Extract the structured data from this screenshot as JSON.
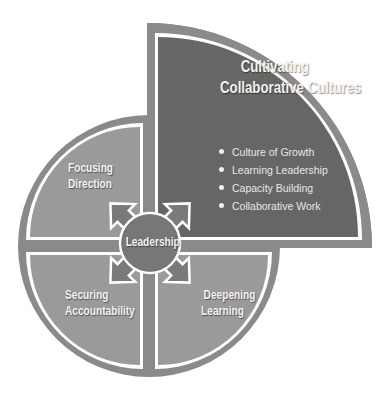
{
  "diagram": {
    "main_quadrant": {
      "title_line1": "Cultivating",
      "title_line2": "Collaborative Cultures",
      "bullets": [
        "Culture of Growth",
        "Learning Leadership",
        "Capacity Building",
        "Collaborative Work"
      ]
    },
    "quadrants": {
      "top_left": {
        "line1": "Focusing",
        "line2": "Direction"
      },
      "bottom_left": {
        "line1": "Securing",
        "line2": "Accountability"
      },
      "bottom_right": {
        "line1": "Deepening",
        "line2": "Learning"
      }
    },
    "hub": {
      "label": "Leadership"
    },
    "colors": {
      "ring": "#8a8a8a",
      "main_fill": "#666666",
      "quadrant_fill": "#9a9a9a",
      "hub_fill": "#777777",
      "separator": "#ffffff"
    }
  }
}
